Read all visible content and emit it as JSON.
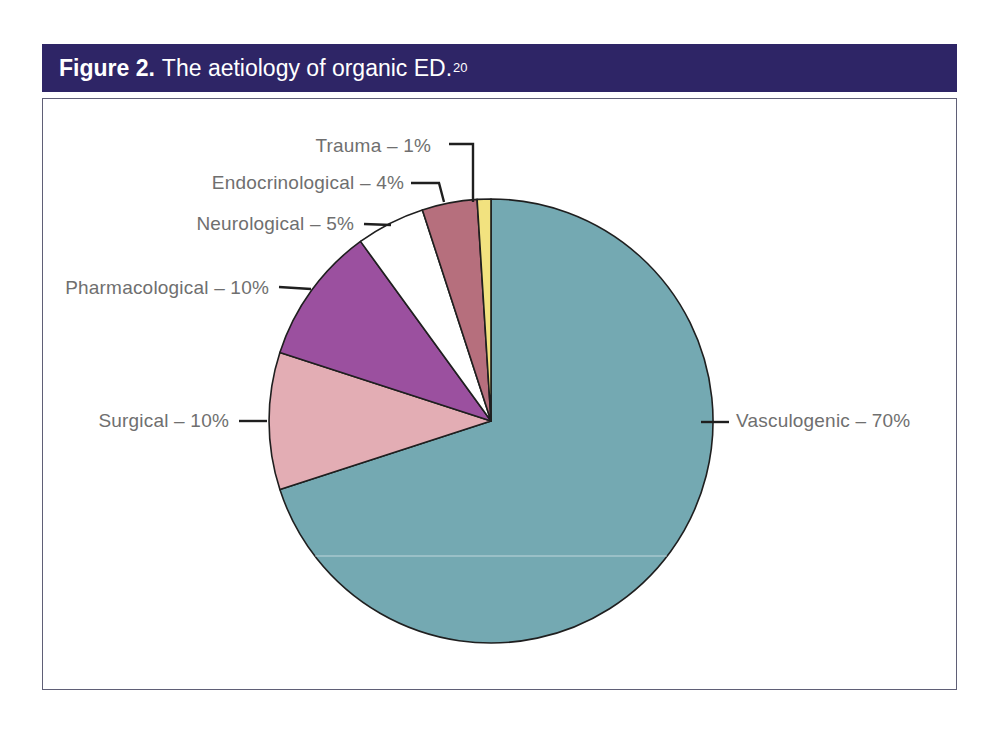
{
  "figure": {
    "label": "Figure 2.",
    "title": "The aetiology of organic ED.",
    "citation": "20"
  },
  "colors": {
    "header_bg": "#2e2566",
    "header_text": "#ffffff",
    "chart_border": "#5f5f76",
    "label_text": "#6f6f6f",
    "line": "#1f1f1f"
  },
  "chart_data": {
    "type": "pie",
    "title": "Figure 2. The aetiology of organic ED.",
    "direction": "clockwise",
    "start_angle_deg": 0,
    "legend_position": "callout-labels",
    "slices": [
      {
        "label": "Vasculogenic",
        "value_pct": 70,
        "display": "Vasculogenic – 70%",
        "color": "#74a9b2"
      },
      {
        "label": "Surgical",
        "value_pct": 10,
        "display": "Surgical – 10%",
        "color": "#e3adb4"
      },
      {
        "label": "Pharmacological",
        "value_pct": 10,
        "display": "Pharmacological – 10%",
        "color": "#9b509f"
      },
      {
        "label": "Neurological",
        "value_pct": 5,
        "display": "Neurological – 5%",
        "color": "#ffffff"
      },
      {
        "label": "Endocrinological",
        "value_pct": 4,
        "display": "Endocrinological – 4%",
        "color": "#b66f7d"
      },
      {
        "label": "Trauma",
        "value_pct": 1,
        "display": "Trauma – 1%",
        "color": "#f2e27f"
      }
    ]
  }
}
